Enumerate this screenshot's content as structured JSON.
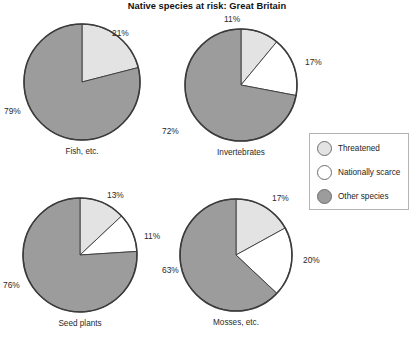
{
  "title": "Native species at risk: Great Britain",
  "colors": {
    "threatened": "#e3e3e3",
    "nationally_scarce": "#ffffff",
    "other_species": "#9c9c9c",
    "outline": "#3b3b3b",
    "legend_border": "#b4b4b4",
    "text": "#1d1d1d",
    "background": "#ffffff"
  },
  "legend": {
    "items": [
      {
        "key": "threatened",
        "label": "Threatened",
        "color": "#e3e3e3"
      },
      {
        "key": "nationally_scarce",
        "label": "Nationally scarce",
        "color": "#ffffff"
      },
      {
        "key": "other_species",
        "label": "Other species",
        "color": "#9c9c9c"
      }
    ]
  },
  "chart_data": {
    "type": "pie",
    "title": "Native species at risk: Great Britain",
    "xlabel": "",
    "ylabel": "",
    "units": "percent",
    "legend_position": "right-middle",
    "grid": false,
    "categories": [
      "Threatened",
      "Nationally scarce",
      "Other species"
    ],
    "charts": [
      {
        "name": "Fish, etc.",
        "caption": "Fish, etc.",
        "center": {
          "x": 82,
          "y": 82
        },
        "radius": 58,
        "start_angle_deg": 0,
        "slices": [
          {
            "category": "Threatened",
            "value": 21,
            "label": "21%",
            "color": "#e3e3e3",
            "label_pos": {
              "x": 112,
              "y": 28
            }
          },
          {
            "category": "Other species",
            "value": 79,
            "label": "79%",
            "color": "#9c9c9c",
            "label_pos": {
              "x": 4,
              "y": 106
            }
          }
        ]
      },
      {
        "name": "Invertebrates",
        "caption": "Invertebrates",
        "center": {
          "x": 241,
          "y": 85
        },
        "radius": 56,
        "start_angle_deg": 0,
        "slices": [
          {
            "category": "Threatened",
            "value": 11,
            "label": "11%",
            "color": "#e3e3e3",
            "label_pos": {
              "x": 224,
              "y": 14
            }
          },
          {
            "category": "Nationally scarce",
            "value": 17,
            "label": "17%",
            "color": "#ffffff",
            "label_pos": {
              "x": 305,
              "y": 57
            }
          },
          {
            "category": "Other species",
            "value": 72,
            "label": "72%",
            "color": "#9c9c9c",
            "label_pos": {
              "x": 162,
              "y": 126
            }
          }
        ]
      },
      {
        "name": "Seed plants",
        "caption": "Seed plants",
        "center": {
          "x": 80,
          "y": 255
        },
        "radius": 57,
        "start_angle_deg": 0,
        "slices": [
          {
            "category": "Threatened",
            "value": 13,
            "label": "13%",
            "color": "#e3e3e3",
            "label_pos": {
              "x": 107,
              "y": 190
            }
          },
          {
            "category": "Nationally scarce",
            "value": 11,
            "label": "11%",
            "color": "#ffffff",
            "label_pos": {
              "x": 144,
              "y": 231
            }
          },
          {
            "category": "Other species",
            "value": 76,
            "label": "76%",
            "color": "#9c9c9c",
            "label_pos": {
              "x": 3,
              "y": 280
            }
          }
        ]
      },
      {
        "name": "Mosses, etc.",
        "caption": "Mosses, etc.",
        "center": {
          "x": 236,
          "y": 255
        },
        "radius": 56,
        "start_angle_deg": 0,
        "slices": [
          {
            "category": "Threatened",
            "value": 17,
            "label": "17%",
            "color": "#e3e3e3",
            "label_pos": {
              "x": 272,
              "y": 193
            }
          },
          {
            "category": "Nationally scarce",
            "value": 20,
            "label": "20%",
            "color": "#ffffff",
            "label_pos": {
              "x": 303,
              "y": 255
            }
          },
          {
            "category": "Other species",
            "value": 63,
            "label": "63%",
            "color": "#9c9c9c",
            "label_pos": {
              "x": 162,
              "y": 265
            }
          }
        ]
      }
    ]
  }
}
